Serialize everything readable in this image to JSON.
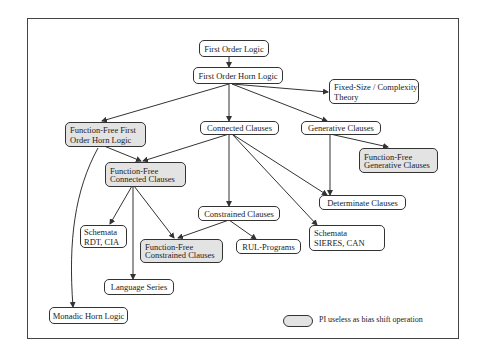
{
  "diagram": {
    "nodes": [
      {
        "id": "fol",
        "label": "First Order Logic",
        "shaded": false
      },
      {
        "id": "fohl",
        "label": "First Order Horn Logic",
        "shaded": false
      },
      {
        "id": "fixed",
        "label_lines": [
          "Fixed-Size / Complexity",
          "Theory"
        ],
        "shaded": false
      },
      {
        "id": "fffohl",
        "label_lines": [
          "Function-Free First",
          "Order Horn Logic"
        ],
        "shaded": true
      },
      {
        "id": "cc",
        "label": "Connected Clauses",
        "shaded": false
      },
      {
        "id": "gc",
        "label": "Generative Clauses",
        "shaded": false
      },
      {
        "id": "ffgc",
        "label_lines": [
          "Function-Free",
          "Generative Clauses"
        ],
        "shaded": true
      },
      {
        "id": "ffcc",
        "label_lines": [
          "Function-Free",
          "Connected Clauses"
        ],
        "shaded": true
      },
      {
        "id": "dc",
        "label": "Determinate Clauses",
        "shaded": false
      },
      {
        "id": "conc",
        "label": "Constrained Clauses",
        "shaded": false
      },
      {
        "id": "srdt",
        "label_lines": [
          "Schemata",
          "RDT, CIA"
        ],
        "shaded": false
      },
      {
        "id": "ffconc",
        "label_lines": [
          "Function-Free",
          "Constrained Clauses"
        ],
        "shaded": true
      },
      {
        "id": "rul",
        "label": "RUL-Programs",
        "shaded": false
      },
      {
        "id": "ssieres",
        "label_lines": [
          "Schemata",
          "SIERES, CAN"
        ],
        "shaded": false
      },
      {
        "id": "ls",
        "label": "Language Series",
        "shaded": false
      },
      {
        "id": "mhl",
        "label": "Monadic Horn Logic",
        "shaded": false
      }
    ],
    "edges": [
      [
        "fol",
        "fohl"
      ],
      [
        "fohl",
        "fixed"
      ],
      [
        "fohl",
        "fffohl"
      ],
      [
        "fohl",
        "cc"
      ],
      [
        "fohl",
        "gc"
      ],
      [
        "gc",
        "ffgc"
      ],
      [
        "gc",
        "dc"
      ],
      [
        "fffohl",
        "ffcc"
      ],
      [
        "fffohl",
        "mhl"
      ],
      [
        "cc",
        "ffcc"
      ],
      [
        "cc",
        "conc"
      ],
      [
        "cc",
        "dc"
      ],
      [
        "cc",
        "ssieres"
      ],
      [
        "ffcc",
        "srdt"
      ],
      [
        "ffcc",
        "ls"
      ],
      [
        "ffcc",
        "ffconc"
      ],
      [
        "conc",
        "ffconc"
      ],
      [
        "conc",
        "rul"
      ]
    ],
    "legend": {
      "label": "PI useless as bias shift operation",
      "swatch_color": "#e3e3e3"
    }
  }
}
